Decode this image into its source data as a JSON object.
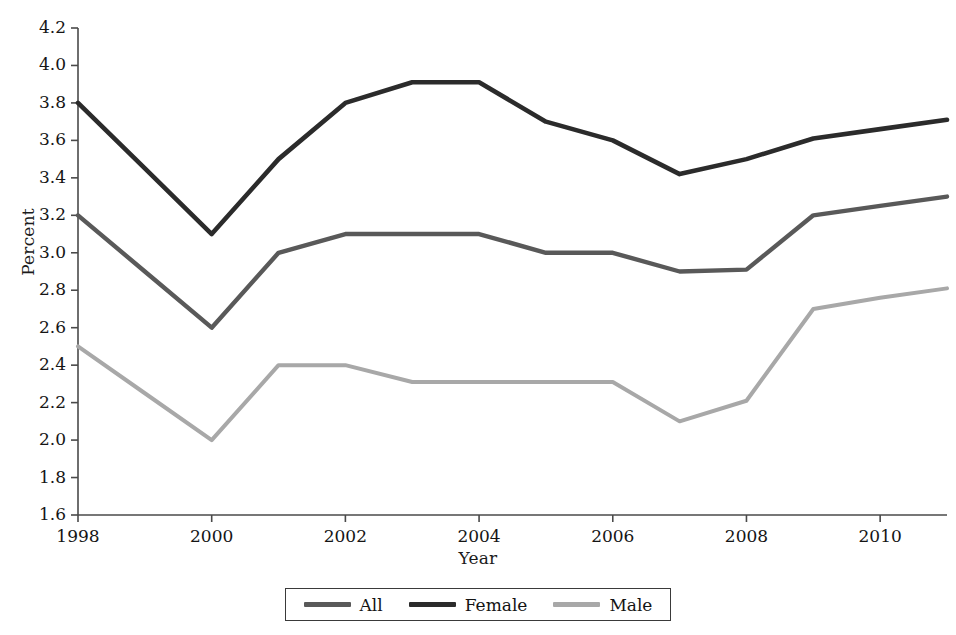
{
  "chart_data": {
    "type": "line",
    "title": "",
    "xlabel": "Year",
    "ylabel": "Percent",
    "x": [
      1998,
      1999,
      2000,
      2001,
      2002,
      2003,
      2004,
      2005,
      2006,
      2007,
      2008,
      2009,
      2010,
      2011
    ],
    "xlim": [
      1998,
      2011
    ],
    "ylim": [
      1.6,
      4.2
    ],
    "xticks": [
      1998,
      2000,
      2002,
      2004,
      2006,
      2008,
      2010
    ],
    "xtick_labels": [
      "1998",
      "2000",
      "2002",
      "2004",
      "2006",
      "2008",
      "2010"
    ],
    "yticks": [
      1.6,
      1.8,
      2.0,
      2.2,
      2.4,
      2.6,
      2.8,
      3.0,
      3.2,
      3.4,
      3.6,
      3.8,
      4.0,
      4.2
    ],
    "ytick_labels": [
      "1.6",
      "1.8",
      "2.0",
      "2.2",
      "2.4",
      "2.6",
      "2.8",
      "3.0",
      "3.2",
      "3.4",
      "3.6",
      "3.8",
      "4.0",
      "4.2"
    ],
    "grid": false,
    "legend_position": "bottom-center",
    "series": [
      {
        "name": "All",
        "color": "#595959",
        "values": [
          3.2,
          2.9,
          2.6,
          3.0,
          3.1,
          3.1,
          3.1,
          3.0,
          3.0,
          2.9,
          2.91,
          3.2,
          3.25,
          3.3
        ]
      },
      {
        "name": "Female",
        "color": "#2b2b2b",
        "values": [
          3.8,
          3.45,
          3.1,
          3.5,
          3.8,
          3.91,
          3.91,
          3.7,
          3.6,
          3.42,
          3.5,
          3.61,
          3.66,
          3.71
        ]
      },
      {
        "name": "Male",
        "color": "#a8a8a8",
        "values": [
          2.5,
          2.25,
          2.0,
          2.4,
          2.4,
          2.31,
          2.31,
          2.31,
          2.31,
          2.1,
          2.21,
          2.7,
          2.76,
          2.81
        ]
      }
    ]
  },
  "legend": {
    "items": [
      {
        "label": "All",
        "color": "#595959"
      },
      {
        "label": "Female",
        "color": "#2b2b2b"
      },
      {
        "label": "Male",
        "color": "#a8a8a8"
      }
    ]
  },
  "axes": {
    "y_title": "Percent",
    "x_title": "Year",
    "axis_color": "#4a4a4a"
  },
  "caption": {
    "text": ""
  }
}
